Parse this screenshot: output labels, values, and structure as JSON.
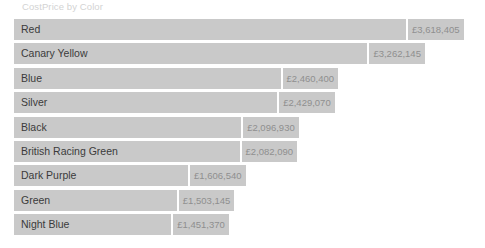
{
  "visual": {
    "title": "CostPrice by Color",
    "currency_symbol": "£",
    "background_color": "#ffffff",
    "bar_color": "#c9c9c9",
    "category_label_color": "#3b3b3b",
    "value_label_color": "#8f8f8f",
    "title_color": "#d3d3d3"
  },
  "chart_data": {
    "type": "bar",
    "orientation": "horizontal",
    "title": "CostPrice by Color",
    "xlabel": "",
    "ylabel": "",
    "grid": false,
    "legend": "none",
    "axis_labels_visible": false,
    "xlim": [
      0,
      3618405
    ],
    "categories": [
      "Red",
      "Canary Yellow",
      "Blue",
      "Silver",
      "Black",
      "British Racing Green",
      "Dark Purple",
      "Green",
      "Night Blue"
    ],
    "values": [
      3618405,
      3262145,
      2460400,
      2429070,
      2096930,
      2082090,
      1606540,
      1503145,
      1451370
    ],
    "value_labels": [
      "£3,618,405",
      "£3,262,145",
      "£2,460,400",
      "£2,429,070",
      "£2,096,930",
      "£2,082,090",
      "£1,606,540",
      "£1,503,145",
      "£1,451,370"
    ]
  }
}
